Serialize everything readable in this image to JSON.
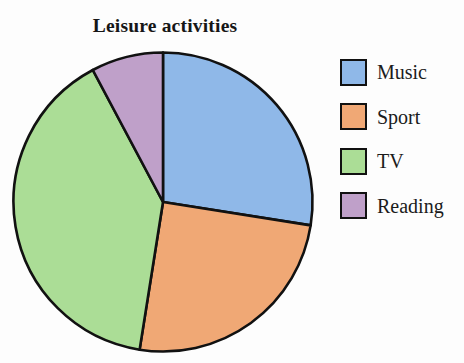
{
  "chart_data": {
    "type": "pie",
    "title": "Leisure activities",
    "xlabel": "",
    "ylabel": "",
    "legend_position": "right",
    "grid": false,
    "start_angle_deg": 0,
    "direction": "clockwise",
    "categories": [
      "Music",
      "Sport",
      "TV",
      "Reading"
    ],
    "values": [
      27.5,
      25.0,
      39.7,
      7.8
    ],
    "units": "percent",
    "colors": [
      "#8FB8E8",
      "#F0A875",
      "#ABDD96",
      "#BFA0C9"
    ],
    "edge_color": "#111111",
    "slices": [
      {
        "label": "Music",
        "value": 27.5,
        "start_deg": 0,
        "end_deg": 99,
        "sweep_deg": 99,
        "color": "#8FB8E8"
      },
      {
        "label": "Sport",
        "value": 25.0,
        "start_deg": 99,
        "end_deg": 189,
        "sweep_deg": 90,
        "color": "#F0A875"
      },
      {
        "label": "TV",
        "value": 39.7,
        "start_deg": 189,
        "end_deg": 332,
        "sweep_deg": 143,
        "color": "#ABDD96"
      },
      {
        "label": "Reading",
        "value": 7.8,
        "start_deg": 332,
        "end_deg": 360,
        "sweep_deg": 28,
        "color": "#BFA0C9"
      }
    ]
  },
  "figure": {
    "background": "#fdfdfd"
  },
  "legend": {
    "items": [
      {
        "label": "Music",
        "color": "#8FB8E8"
      },
      {
        "label": "Sport",
        "color": "#F0A875"
      },
      {
        "label": "TV",
        "color": "#ABDD96"
      },
      {
        "label": "Reading",
        "color": "#BFA0C9"
      }
    ]
  }
}
